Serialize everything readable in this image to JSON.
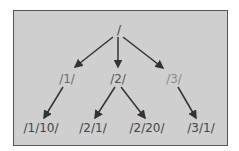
{
  "diagram": {
    "type": "tree",
    "root": {
      "label": "/",
      "color": "#444444"
    },
    "level1": [
      {
        "label": "/1/",
        "color": "#6a6a6a"
      },
      {
        "label": "/2/",
        "color": "#555555"
      },
      {
        "label": "/3/",
        "color": "#8a8a8a"
      }
    ],
    "level2": [
      {
        "label": "/1/10/",
        "parent": "/1/",
        "color": "#444444"
      },
      {
        "label": "/2/1/",
        "parent": "/2/",
        "color": "#444444"
      },
      {
        "label": "/2/20/",
        "parent": "/2/",
        "color": "#444444"
      },
      {
        "label": "/3/1/",
        "parent": "/3/",
        "color": "#444444"
      }
    ],
    "colors": {
      "background": "#cfcfcf",
      "border": "#555555",
      "arrow": "#333333"
    }
  }
}
